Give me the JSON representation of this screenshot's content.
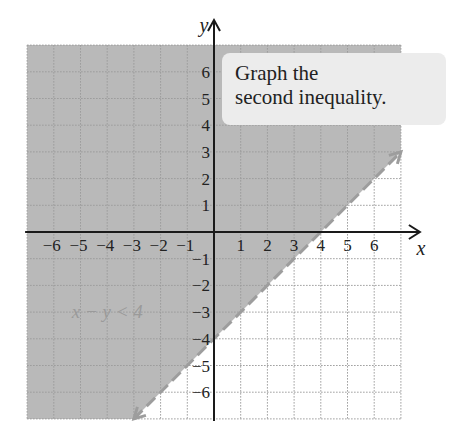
{
  "callout": {
    "line1": "Graph the",
    "line2": "second inequality."
  },
  "colors": {
    "shade": "#b9b9b9",
    "grid": "#6f6f6f",
    "grid_white": "#9a9a9a",
    "axis": "#1a1a1a",
    "boundary": "#9d9d9d",
    "label": "#9a9a9a",
    "callout_bg": "#ececec"
  },
  "chart_data": {
    "type": "line",
    "title": "Graph the second inequality.",
    "xlabel": "x",
    "ylabel": "y",
    "xlim": [
      -7,
      7
    ],
    "ylim": [
      -7,
      7
    ],
    "grid": true,
    "x_ticks": [
      "-6",
      "-5",
      "-4",
      "-3",
      "-2",
      "-1",
      "1",
      "2",
      "3",
      "4",
      "5",
      "6"
    ],
    "y_ticks": [
      "6",
      "5",
      "4",
      "3",
      "2",
      "1",
      "-1",
      "-2",
      "-3",
      "-4",
      "-5",
      "-6"
    ],
    "series": [
      {
        "name": "x - y = 4 (boundary, dashed)",
        "equation": "y = x - 4",
        "style": "dashed",
        "x": [
          -3,
          7
        ],
        "y": [
          -7,
          3
        ]
      }
    ],
    "shaded_region": "above boundary line (y > x - 4)",
    "annotations": [
      {
        "text": "x − y < 4",
        "x": -4.5,
        "y": -3
      }
    ]
  }
}
